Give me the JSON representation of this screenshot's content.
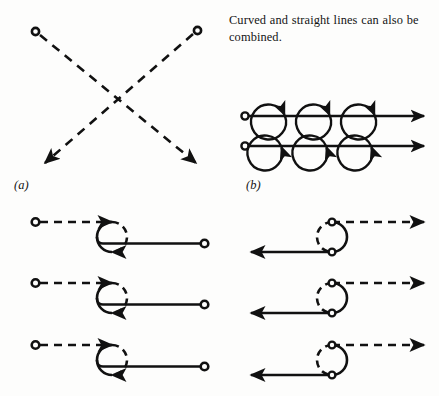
{
  "figure": {
    "background_color": "#fdfdfc",
    "ink_color": "#111111",
    "caption": "Curved and straight lines can also be combined.",
    "labels": {
      "panel_a": "(a)",
      "panel_b": "(b)"
    },
    "panels": [
      {
        "id": "a",
        "label": "(a)",
        "description": "Two crossing dashed diagonal lines, each starting at a small open ring marker and ending in a solid filled arrowhead, forming an X.",
        "strokes": [
          {
            "from": [
              35,
              31
            ],
            "to": [
              200,
              166
            ],
            "style": "dashed",
            "start_marker": "ring",
            "end_marker": "arrowhead"
          },
          {
            "from": [
              197,
              29
            ],
            "to": [
              40,
              167
            ],
            "style": "dashed",
            "start_marker": "ring",
            "end_marker": "arrowhead"
          }
        ]
      },
      {
        "id": "b",
        "label": "(b)",
        "description": "Two horizontal solid lines with three loops each; upper row loops sit above the line, lower row loops hang below the line. Each line starts with an open ring and ends with a filled arrowhead.",
        "rows": [
          {
            "baseline_y": 116,
            "loops": "above",
            "loop_count": 3,
            "start_marker": "ring",
            "end_marker": "arrowhead"
          },
          {
            "baseline_y": 146,
            "loops": "below",
            "loop_count": 3,
            "start_marker": "ring",
            "end_marker": "arrowhead"
          }
        ]
      },
      {
        "id": "c",
        "label": "",
        "description": "Three identical rows: open ring start, dashed horizontal line running right, a loop that is dashed on its right half and solid on its left half with two arrowheads, then a solid horizontal line running right to an open ring terminator.",
        "row_count": 3,
        "rows": [
          {
            "start": [
              35,
              222
            ],
            "end": [
              205,
              243
            ]
          },
          {
            "start": [
              35,
              283
            ],
            "end": [
              205,
              304
            ]
          },
          {
            "start": [
              35,
              345
            ],
            "end": [
              205,
              366
            ]
          }
        ]
      },
      {
        "id": "d",
        "label": "",
        "description": "Three identical mirrored rows: dashed line running right ending in a filled arrowhead, a loop dashed on its left half and solid on its right half containing two small open ring markers, and a solid line running left ending in a filled arrowhead.",
        "row_count": 3,
        "rows": [
          {
            "top_y": 222,
            "bottom_y": 252
          },
          {
            "top_y": 283,
            "bottom_y": 313
          },
          {
            "top_y": 345,
            "bottom_y": 375
          }
        ]
      }
    ],
    "markers": {
      "ring": "open-circle-endpoint",
      "arrowhead": "solid-filled-triangle"
    }
  }
}
